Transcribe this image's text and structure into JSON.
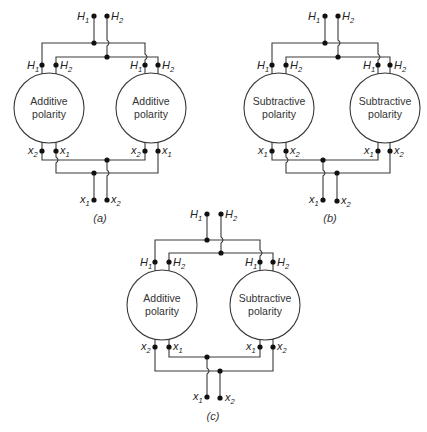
{
  "figure": {
    "panels": [
      {
        "id": "a",
        "caption": "(a)",
        "left_transformer": {
          "line1": "Additive",
          "line2": "polarity",
          "top_terminals": [
            "H1",
            "H2"
          ],
          "bottom_terminals": [
            "x2",
            "x1"
          ]
        },
        "right_transformer": {
          "line1": "Additive",
          "line2": "polarity",
          "top_terminals": [
            "H1",
            "H2"
          ],
          "bottom_terminals": [
            "x2",
            "x1"
          ]
        },
        "supply_terminals": [
          "H1",
          "H2"
        ],
        "load_terminals": [
          "x1",
          "x2"
        ]
      },
      {
        "id": "b",
        "caption": "(b)",
        "left_transformer": {
          "line1": "Subtractive",
          "line2": "polarity",
          "top_terminals": [
            "H1",
            "H2"
          ],
          "bottom_terminals": [
            "x1",
            "x2"
          ]
        },
        "right_transformer": {
          "line1": "Subtractive",
          "line2": "polarity",
          "top_terminals": [
            "H1",
            "H2"
          ],
          "bottom_terminals": [
            "x1",
            "x2"
          ]
        },
        "supply_terminals": [
          "H1",
          "H2"
        ],
        "load_terminals": [
          "x1",
          "x2"
        ]
      },
      {
        "id": "c",
        "caption": "(c)",
        "left_transformer": {
          "line1": "Additive",
          "line2": "polarity",
          "top_terminals": [
            "H1",
            "H2"
          ],
          "bottom_terminals": [
            "x2",
            "x1"
          ]
        },
        "right_transformer": {
          "line1": "Subtractive",
          "line2": "polarity",
          "top_terminals": [
            "H1",
            "H2"
          ],
          "bottom_terminals": [
            "x1",
            "x2"
          ]
        },
        "supply_terminals": [
          "H1",
          "H2"
        ],
        "load_terminals": [
          "x1",
          "x2"
        ]
      }
    ]
  }
}
